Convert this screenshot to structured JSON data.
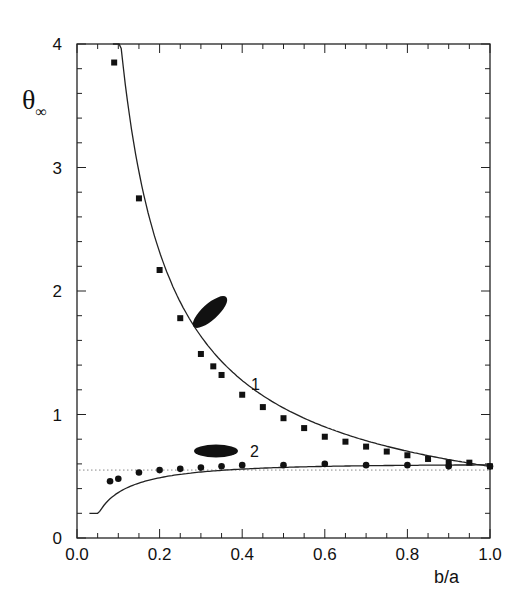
{
  "chart_data": {
    "type": "scatter",
    "title": "",
    "xlabel": "b/a",
    "ylabel": "θ∞",
    "ylabel_main": "θ",
    "ylabel_sub": "∞",
    "xlim": [
      0.0,
      1.0
    ],
    "ylim": [
      0,
      4
    ],
    "xticks": [
      "0.0",
      "0.2",
      "0.4",
      "0.6",
      "0.8",
      "1.0"
    ],
    "yticks": [
      "0",
      "1",
      "2",
      "3",
      "4"
    ],
    "grid": false,
    "legend": "none (inline curve labels 1 and 2 with ellipsoid icons)",
    "series": [
      {
        "name": "1",
        "marker": "square",
        "annotation_icon": "prolate-ellipse-tilted",
        "x": [
          0.09,
          0.15,
          0.2,
          0.25,
          0.3,
          0.33,
          0.35,
          0.4,
          0.45,
          0.5,
          0.55,
          0.6,
          0.65,
          0.7,
          0.75,
          0.8,
          0.85,
          0.9,
          0.95,
          1.0
        ],
        "y": [
          3.85,
          2.75,
          2.17,
          1.78,
          1.49,
          1.39,
          1.32,
          1.16,
          1.06,
          0.97,
          0.89,
          0.82,
          0.78,
          0.74,
          0.7,
          0.67,
          0.64,
          0.61,
          0.61,
          0.58
        ],
        "fit_curve": "solid line, approx 0.58·(b/a)^-0.9 style decay from ~4.0 at 0.09 to 0.58 at 1.0"
      },
      {
        "name": "2",
        "marker": "circle",
        "annotation_icon": "oblate-ellipse-horizontal",
        "x": [
          0.08,
          0.1,
          0.15,
          0.2,
          0.25,
          0.3,
          0.35,
          0.4,
          0.5,
          0.6,
          0.7,
          0.8,
          0.9,
          1.0
        ],
        "y": [
          0.46,
          0.48,
          0.53,
          0.55,
          0.56,
          0.57,
          0.58,
          0.59,
          0.59,
          0.6,
          0.59,
          0.59,
          0.58,
          0.58
        ],
        "fit_curve": "solid line rising from ~0.25 at 0.03 to plateau ~0.59"
      },
      {
        "name": "reference",
        "style": "dotted horizontal line",
        "y_constant": 0.55
      }
    ],
    "annotations": [
      {
        "text": "1",
        "x": 0.5,
        "y": 1.23
      },
      {
        "text": "2",
        "x": 0.4,
        "y": 0.72
      }
    ]
  },
  "labels": {
    "curve1": "1",
    "curve2": "2",
    "xaxis": "b/a",
    "ytheta": "θ",
    "yinf": "∞"
  }
}
